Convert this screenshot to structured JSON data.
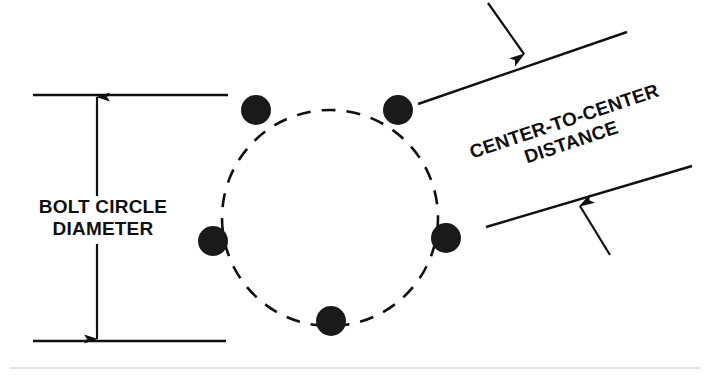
{
  "diagram": {
    "labels": {
      "bolt_circle_diameter": "BOLT CIRCLE\nDIAMETER",
      "center_to_center_line1": "CENTER-TO-CENTER",
      "center_to_center_line2": "DISTANCE"
    },
    "colors": {
      "ink": "#101010",
      "background": "#ffffff",
      "bolt_fill": "#1a1a1a",
      "footer_rule": "#d8d8d8"
    },
    "bolt_circle": {
      "center_x": 330,
      "center_y": 218,
      "radius": 108,
      "style": "dashed",
      "dash_pattern": "14 11"
    },
    "bolts": [
      {
        "name": "bolt-top-left",
        "cx": 256,
        "cy": 110,
        "r": 15
      },
      {
        "name": "bolt-top-right",
        "cx": 398,
        "cy": 110,
        "r": 15
      },
      {
        "name": "bolt-left",
        "cx": 213,
        "cy": 241,
        "r": 15
      },
      {
        "name": "bolt-right",
        "cx": 446,
        "cy": 238,
        "r": 15
      },
      {
        "name": "bolt-bottom",
        "cx": 331,
        "cy": 321,
        "r": 15
      }
    ],
    "bolt_count": 5,
    "dimension": {
      "extension_line_top": {
        "x1": 33,
        "y1": 95,
        "x2": 228,
        "y2": 95
      },
      "extension_line_bottom": {
        "x1": 33,
        "y1": 341,
        "x2": 226,
        "y2": 341
      },
      "dimension_line": {
        "x": 97,
        "y_top": 95,
        "y_bottom": 341
      },
      "arrow_top_direction": "up",
      "arrow_bottom_direction": "down"
    },
    "leaders": {
      "upper_line": {
        "x1": 418,
        "y1": 104,
        "x2": 627,
        "y2": 32
      },
      "upper_arrow": {
        "x1": 488,
        "y1": 3,
        "x2": 526,
        "y2": 57,
        "direction": "down-right"
      },
      "lower_line": {
        "x1": 486,
        "y1": 227,
        "x2": 690,
        "y2": 167
      },
      "lower_arrow": {
        "x1": 608,
        "y1": 253,
        "x2": 578,
        "y2": 203,
        "direction": "up-left"
      }
    },
    "footer_rule": {
      "x1": 10,
      "y1": 368,
      "x2": 700,
      "y2": 368
    }
  }
}
